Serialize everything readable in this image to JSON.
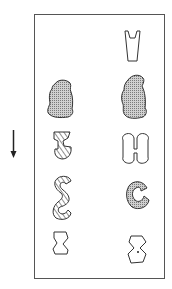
{
  "figure": {
    "colors": {
      "stroke": "#333333",
      "frame": "#555555",
      "stipple": "#9a9a9a",
      "background": "#ffffff"
    },
    "arrow": {
      "direction": "down"
    },
    "left_column": [
      {
        "shape": "blob",
        "fill": "stippled"
      },
      {
        "shape": "twisted-ribbon",
        "fill": "hatched"
      },
      {
        "shape": "s-curve",
        "fill": "hatched"
      },
      {
        "shape": "pinched-block",
        "fill": "none"
      }
    ],
    "right_column": [
      {
        "shape": "notched-trapezoid",
        "fill": "none"
      },
      {
        "shape": "blob",
        "fill": "stippled"
      },
      {
        "shape": "h-dumbbell",
        "fill": "none"
      },
      {
        "shape": "c-ring",
        "fill": "stippled"
      },
      {
        "shape": "pinched-block-dot",
        "fill": "none"
      }
    ]
  }
}
